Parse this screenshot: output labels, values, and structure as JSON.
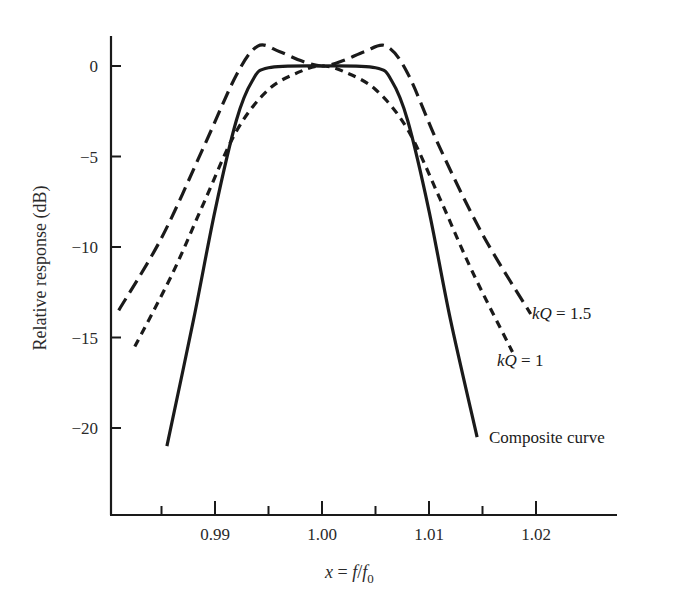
{
  "chart_data": {
    "type": "line",
    "title": "",
    "xlabel": "x = f/f0",
    "xlabel_parts": {
      "x": "x",
      "eq": " = ",
      "f": "f",
      "slash": "/",
      "f0": "f",
      "sub": "0"
    },
    "ylabel": "Relative response (dB)",
    "xlim": [
      0.98,
      1.025
    ],
    "ylim": [
      -24.5,
      2.5
    ],
    "x_ticks": [
      0.99,
      1.0,
      1.01,
      1.02
    ],
    "x_tick_labels": [
      "0.99",
      "1.00",
      "1.01",
      "1.02"
    ],
    "x_minor_ticks": [
      0.985,
      0.995,
      1.005,
      1.015
    ],
    "y_ticks": [
      0,
      -5,
      -10,
      -15,
      -20
    ],
    "y_tick_labels": [
      "0",
      "−5",
      "−10",
      "−15",
      "−20"
    ],
    "grid": false,
    "legend": "inline labels at curve ends",
    "series": [
      {
        "name": "kQ = 1.5",
        "label_k": "kQ",
        "label_val": " = 1.5",
        "style": "long-dash",
        "x": [
          0.981,
          0.985,
          0.989,
          0.992,
          0.994,
          0.996,
          0.998,
          1.0,
          1.002,
          1.004,
          1.006,
          1.008,
          1.011,
          1.015,
          1.0195
        ],
        "y": [
          -13.5,
          -9.5,
          -4.4,
          -0.5,
          1.1,
          0.8,
          0.3,
          0.0,
          0.3,
          0.8,
          1.1,
          -0.4,
          -4.5,
          -9.3,
          -13.7
        ]
      },
      {
        "name": "kQ = 1",
        "label_k": "kQ",
        "label_val": " = 1",
        "style": "short-dash",
        "x": [
          0.9825,
          0.986,
          0.989,
          0.992,
          0.995,
          0.998,
          1.0,
          1.002,
          1.005,
          1.008,
          1.011,
          1.014,
          1.0178
        ],
        "y": [
          -15.5,
          -11.5,
          -7.5,
          -3.6,
          -1.3,
          -0.3,
          0.0,
          -0.3,
          -1.3,
          -3.5,
          -7.3,
          -11.3,
          -15.8
        ]
      },
      {
        "name": "Composite curve",
        "label_val": "Composite curve",
        "style": "solid",
        "x": [
          0.9855,
          0.988,
          0.99,
          0.992,
          0.9935,
          0.995,
          1.0,
          1.005,
          1.0065,
          1.008,
          1.01,
          1.012,
          1.0145
        ],
        "y": [
          -21.0,
          -14.0,
          -8.0,
          -3.0,
          -0.8,
          -0.1,
          0.0,
          -0.1,
          -0.8,
          -3.0,
          -8.0,
          -14.0,
          -20.5
        ]
      }
    ]
  }
}
